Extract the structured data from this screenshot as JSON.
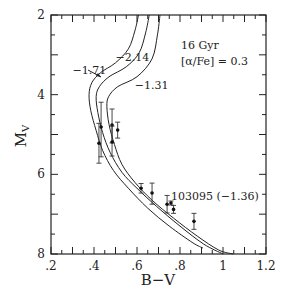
{
  "chart_data": {
    "type": "line",
    "title": "",
    "xlabel": "B−V",
    "ylabel": "M_V",
    "xlim": [
      0.2,
      1.2
    ],
    "ylim": [
      8,
      2
    ],
    "y_inverted": true,
    "grid": false,
    "x_ticks": [
      {
        "value": 0.2,
        "label": ".2"
      },
      {
        "value": 0.4,
        "label": ".4"
      },
      {
        "value": 0.6,
        "label": ".6"
      },
      {
        "value": 0.8,
        "label": ".8"
      },
      {
        "value": 1.0,
        "label": "1"
      },
      {
        "value": 1.2,
        "label": "1.2"
      }
    ],
    "y_ticks": [
      {
        "value": 2,
        "label": "2"
      },
      {
        "value": 4,
        "label": "4"
      },
      {
        "value": 6,
        "label": "6"
      },
      {
        "value": 8,
        "label": "8"
      }
    ],
    "annotations": {
      "age": "16 Gyr",
      "alpha_fe": "[α/Fe] = 0.3",
      "star_label": "103095 (−1.36)"
    },
    "series": [
      {
        "name": "−2.14",
        "label_pos": [
          0.5,
          3.15
        ],
        "points": [
          [
            0.607,
            2.0
          ],
          [
            0.59,
            2.4
          ],
          [
            0.56,
            2.85
          ],
          [
            0.5,
            3.2
          ],
          [
            0.43,
            3.45
          ],
          [
            0.39,
            3.7
          ],
          [
            0.377,
            4.0
          ],
          [
            0.385,
            4.4
          ],
          [
            0.41,
            4.9
          ],
          [
            0.44,
            5.4
          ],
          [
            0.49,
            5.9
          ],
          [
            0.56,
            6.35
          ],
          [
            0.65,
            6.85
          ],
          [
            0.75,
            7.3
          ],
          [
            0.86,
            7.72
          ],
          [
            0.907,
            7.85
          ]
        ]
      },
      {
        "name": "−1.71",
        "label_pos": [
          0.3,
          3.48
        ],
        "points": [
          [
            0.657,
            2.0
          ],
          [
            0.64,
            2.45
          ],
          [
            0.61,
            2.95
          ],
          [
            0.55,
            3.3
          ],
          [
            0.47,
            3.55
          ],
          [
            0.425,
            3.8
          ],
          [
            0.41,
            4.05
          ],
          [
            0.418,
            4.45
          ],
          [
            0.44,
            4.95
          ],
          [
            0.475,
            5.45
          ],
          [
            0.53,
            5.95
          ],
          [
            0.6,
            6.35
          ],
          [
            0.69,
            6.8
          ],
          [
            0.8,
            7.3
          ],
          [
            0.91,
            7.75
          ],
          [
            1.0,
            8.0
          ]
        ]
      },
      {
        "name": "−1.31",
        "label_pos": [
          0.59,
          3.85
        ],
        "points": [
          [
            0.707,
            2.0
          ],
          [
            0.695,
            2.5
          ],
          [
            0.67,
            3.1
          ],
          [
            0.6,
            3.55
          ],
          [
            0.51,
            3.8
          ],
          [
            0.468,
            4.05
          ],
          [
            0.46,
            4.3
          ],
          [
            0.47,
            4.75
          ],
          [
            0.495,
            5.25
          ],
          [
            0.53,
            5.75
          ],
          [
            0.59,
            6.2
          ],
          [
            0.67,
            6.65
          ],
          [
            0.77,
            7.1
          ],
          [
            0.88,
            7.55
          ],
          [
            0.98,
            7.9
          ],
          [
            1.047,
            8.0
          ]
        ]
      }
    ],
    "data_points": [
      {
        "x": 0.433,
        "y": 4.81,
        "err_up": 0.62,
        "err_down": 0.75
      },
      {
        "x": 0.423,
        "y": 5.22,
        "err_up": 0.5,
        "err_down": 0.5
      },
      {
        "x": 0.484,
        "y": 4.76,
        "err_up": 0.4,
        "err_down": 0.45
      },
      {
        "x": 0.484,
        "y": 5.19,
        "err_up": 0.4,
        "err_down": 0.35
      },
      {
        "x": 0.51,
        "y": 4.89,
        "err_up": 0.2,
        "err_down": 0.2
      },
      {
        "x": 0.619,
        "y": 6.35,
        "err_up": 0.12,
        "err_down": 0.12
      },
      {
        "x": 0.67,
        "y": 6.47,
        "err_up": 0.25,
        "err_down": 0.28
      },
      {
        "x": 0.74,
        "y": 6.75,
        "err_up": 0.22,
        "err_down": 0.22
      },
      {
        "x": 0.758,
        "y": 6.72,
        "err_up": 0.05,
        "err_down": 0.05,
        "label": "103095 (−1.36)"
      },
      {
        "x": 0.77,
        "y": 6.88,
        "err_up": 0.1,
        "err_down": 0.1
      },
      {
        "x": 0.865,
        "y": 7.18,
        "err_up": 0.2,
        "err_down": 0.2
      }
    ]
  }
}
